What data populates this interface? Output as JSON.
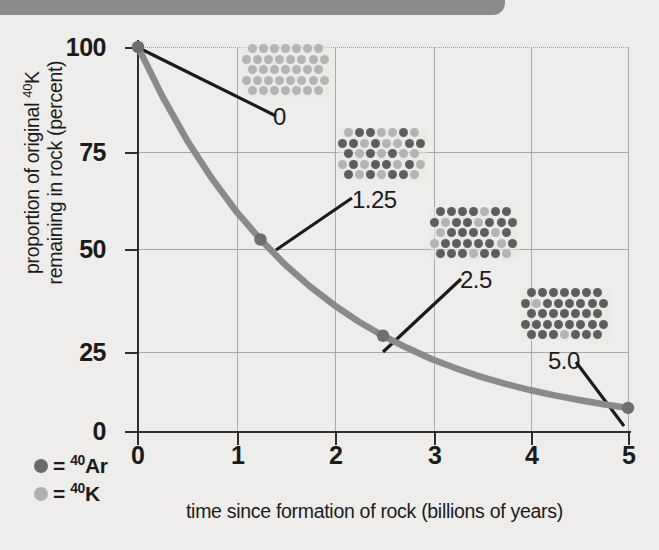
{
  "chart_data": {
    "type": "line",
    "title": "",
    "xlabel": "time since formation of rock (billions of years)",
    "ylabel_line1": "proportion of original ",
    "ylabel_sup": "40",
    "ylabel_line1b": "K",
    "ylabel_line2": "remaining in rock (percent)",
    "xlim": [
      0,
      5
    ],
    "ylim": [
      0,
      100
    ],
    "xticks": [
      "0",
      "1",
      "2",
      "3",
      "4",
      "5"
    ],
    "yticks": [
      "100",
      "75",
      "50",
      "25",
      "0"
    ],
    "grid": true,
    "half_life_billion_years": 1.25,
    "series": [
      {
        "name": "40K remaining",
        "x": [
          0,
          0.25,
          0.5,
          0.75,
          1.0,
          1.25,
          1.5,
          1.75,
          2.0,
          2.25,
          2.5,
          2.75,
          3.0,
          3.25,
          3.5,
          3.75,
          4.0,
          4.25,
          4.5,
          4.75,
          5.0
        ],
        "y": [
          100,
          87.1,
          75.8,
          66.0,
          57.4,
          50.0,
          43.5,
          37.9,
          33.0,
          28.7,
          25.0,
          21.8,
          18.9,
          16.5,
          14.3,
          12.5,
          10.9,
          9.5,
          8.3,
          7.2,
          6.25
        ]
      }
    ],
    "markers": [
      {
        "label": "0",
        "x": 0,
        "y": 100
      },
      {
        "label": "1.25",
        "x": 1.25,
        "y": 50
      },
      {
        "label": "2.5",
        "x": 2.5,
        "y": 25
      },
      {
        "label": "5.0",
        "x": 5.0,
        "y": 6.25
      }
    ],
    "legend_position": "bottom-left",
    "curve_color": "#8a8a8a",
    "marker_color": "#6e6e6e",
    "leader_color": "#1b1b1b"
  },
  "legend": {
    "items": [
      {
        "icon": "dark-circle-icon",
        "equals": "=",
        "sup": "40",
        "element": "Ar",
        "color": "#6a6a6a"
      },
      {
        "icon": "light-circle-icon",
        "equals": "=",
        "sup": "40",
        "element": "K",
        "color": "#b0b0b0"
      }
    ]
  },
  "insets": [
    {
      "name": "atom-grid-t0",
      "label": "0",
      "time": 0,
      "k_atoms": 38,
      "ar_atoms": 0,
      "rows": [
        [
          "k",
          "k",
          "k",
          "k",
          "k",
          "k",
          "k"
        ],
        [
          "k",
          "k",
          "k",
          "k",
          "k",
          "k",
          "k",
          "k"
        ],
        [
          "k",
          "k",
          "k",
          "k",
          "k",
          "k",
          "k"
        ],
        [
          "k",
          "k",
          "k",
          "k",
          "k",
          "k",
          "k",
          "k"
        ],
        [
          "k",
          "k",
          "k",
          "k",
          "k",
          "k",
          "k"
        ]
      ]
    },
    {
      "name": "atom-grid-t125",
      "label": "1.25",
      "time": 1.25,
      "k_atoms": 19,
      "ar_atoms": 19,
      "rows": [
        [
          "k",
          "ar",
          "ar",
          "k",
          "k",
          "ar",
          "k"
        ],
        [
          "ar",
          "ar",
          "k",
          "ar",
          "k",
          "k",
          "ar",
          "ar"
        ],
        [
          "ar",
          "k",
          "ar",
          "k",
          "ar",
          "k",
          "k"
        ],
        [
          "k",
          "ar",
          "k",
          "ar",
          "ar",
          "k",
          "ar",
          "k"
        ],
        [
          "ar",
          "k",
          "ar",
          "k",
          "ar",
          "ar",
          "k"
        ]
      ]
    },
    {
      "name": "atom-grid-t25",
      "label": "2.5",
      "time": 2.5,
      "k_atoms": 10,
      "ar_atoms": 28,
      "rows": [
        [
          "ar",
          "ar",
          "ar",
          "ar",
          "k",
          "ar",
          "ar"
        ],
        [
          "ar",
          "k",
          "ar",
          "ar",
          "k",
          "ar",
          "ar",
          "ar"
        ],
        [
          "k",
          "ar",
          "ar",
          "ar",
          "ar",
          "k",
          "ar"
        ],
        [
          "k",
          "ar",
          "ar",
          "ar",
          "ar",
          "ar",
          "k",
          "ar"
        ],
        [
          "ar",
          "ar",
          "ar",
          "k",
          "ar",
          "ar",
          "k"
        ]
      ]
    },
    {
      "name": "atom-grid-t50",
      "label": "5.0",
      "time": 5.0,
      "k_atoms": 2,
      "ar_atoms": 36,
      "rows": [
        [
          "ar",
          "ar",
          "ar",
          "ar",
          "ar",
          "ar",
          "ar"
        ],
        [
          "ar",
          "k",
          "ar",
          "ar",
          "ar",
          "ar",
          "ar",
          "ar"
        ],
        [
          "ar",
          "ar",
          "ar",
          "ar",
          "ar",
          "ar",
          "ar"
        ],
        [
          "ar",
          "ar",
          "ar",
          "ar",
          "ar",
          "ar",
          "ar",
          "ar"
        ],
        [
          "ar",
          "ar",
          "ar",
          "k",
          "ar",
          "ar",
          "ar"
        ]
      ]
    }
  ]
}
